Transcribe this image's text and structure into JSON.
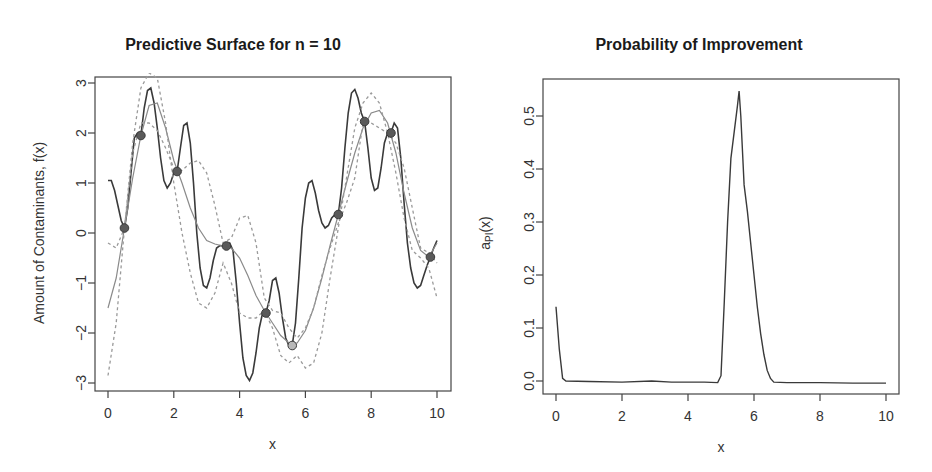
{
  "chart_data": [
    {
      "type": "line",
      "title": "Predictive Surface for n = 10",
      "xlabel": "x",
      "ylabel": "Amount of Contaminants, f(x)",
      "xlim": [
        0,
        10
      ],
      "ylim": [
        -3,
        3
      ],
      "xticks": [
        "0",
        "2",
        "4",
        "6",
        "8",
        "10"
      ],
      "yticks": [
        "-3",
        "-2",
        "-1",
        "0",
        "1",
        "2",
        "3"
      ],
      "grid": false,
      "legend": null,
      "points": {
        "x": [
          0.5,
          1.0,
          2.1,
          3.6,
          4.8,
          5.6,
          7.0,
          7.8,
          8.6,
          9.8
        ],
        "y": [
          0.1,
          1.95,
          1.23,
          -0.26,
          -1.6,
          -2.25,
          0.37,
          2.23,
          2.0,
          -0.48
        ],
        "highlight_index": 5
      },
      "series": [
        {
          "name": "sample path (dark solid)",
          "style": "solid-dark",
          "x": [
            0.0,
            0.1,
            0.2,
            0.3,
            0.4,
            0.5,
            0.6,
            0.7,
            0.8,
            0.9,
            1.0,
            1.1,
            1.2,
            1.3,
            1.4,
            1.5,
            1.6,
            1.7,
            1.8,
            1.9,
            2.0,
            2.1,
            2.2,
            2.3,
            2.4,
            2.5,
            2.6,
            2.7,
            2.8,
            2.9,
            3.0,
            3.1,
            3.2,
            3.3,
            3.4,
            3.5,
            3.6,
            3.7,
            3.8,
            3.9,
            4.0,
            4.1,
            4.2,
            4.3,
            4.4,
            4.5,
            4.6,
            4.7,
            4.8,
            4.9,
            5.0,
            5.1,
            5.2,
            5.3,
            5.4,
            5.5,
            5.6,
            5.7,
            5.8,
            5.9,
            6.0,
            6.1,
            6.2,
            6.3,
            6.4,
            6.5,
            6.6,
            6.7,
            6.8,
            6.9,
            7.0,
            7.1,
            7.2,
            7.3,
            7.4,
            7.5,
            7.6,
            7.7,
            7.8,
            7.9,
            8.0,
            8.1,
            8.2,
            8.3,
            8.4,
            8.5,
            8.6,
            8.7,
            8.8,
            8.9,
            9.0,
            9.1,
            9.2,
            9.3,
            9.4,
            9.5,
            9.6,
            9.7,
            9.8,
            9.9,
            10.0
          ],
          "y": [
            1.05,
            1.05,
            0.85,
            0.55,
            0.25,
            0.1,
            0.5,
            1.2,
            1.9,
            2.0,
            1.95,
            2.5,
            2.85,
            2.9,
            2.6,
            2.1,
            1.5,
            1.05,
            0.9,
            1.0,
            1.2,
            1.23,
            1.7,
            2.15,
            2.2,
            1.8,
            1.0,
            0.0,
            -0.7,
            -1.05,
            -1.1,
            -0.9,
            -0.55,
            -0.3,
            -0.25,
            -0.26,
            -0.26,
            -0.2,
            -0.35,
            -1.0,
            -1.8,
            -2.5,
            -2.85,
            -2.95,
            -2.8,
            -2.4,
            -1.9,
            -1.6,
            -1.6,
            -1.35,
            -0.95,
            -0.9,
            -1.2,
            -1.7,
            -2.1,
            -2.25,
            -2.25,
            -1.8,
            -0.9,
            0.1,
            0.7,
            1.0,
            1.05,
            0.8,
            0.45,
            0.2,
            0.1,
            0.15,
            0.3,
            0.37,
            0.37,
            0.9,
            1.7,
            2.4,
            2.8,
            2.87,
            2.7,
            2.4,
            2.23,
            1.7,
            1.1,
            0.85,
            0.9,
            1.3,
            1.8,
            2.0,
            2.0,
            2.2,
            2.1,
            1.5,
            0.6,
            -0.2,
            -0.7,
            -1.0,
            -1.1,
            -1.05,
            -0.85,
            -0.65,
            -0.48,
            -0.3,
            -0.15
          ]
        },
        {
          "name": "predictive mean (gray solid)",
          "style": "solid-gray",
          "x": [
            0.0,
            0.25,
            0.5,
            0.75,
            1.0,
            1.25,
            1.5,
            1.75,
            2.0,
            2.25,
            2.5,
            2.75,
            3.0,
            3.25,
            3.5,
            3.75,
            4.0,
            4.25,
            4.5,
            4.75,
            5.0,
            5.25,
            5.5,
            5.75,
            6.0,
            6.25,
            6.5,
            6.75,
            7.0,
            7.25,
            7.5,
            7.75,
            8.0,
            8.25,
            8.5,
            8.75,
            9.0,
            9.25,
            9.5,
            9.75,
            10.0
          ],
          "y": [
            -1.5,
            -0.9,
            0.1,
            1.1,
            1.95,
            2.55,
            2.6,
            2.1,
            1.45,
            1.0,
            0.5,
            0.1,
            -0.15,
            -0.22,
            -0.26,
            -0.3,
            -0.5,
            -0.85,
            -1.25,
            -1.55,
            -1.8,
            -2.05,
            -2.2,
            -2.2,
            -1.95,
            -1.5,
            -0.9,
            -0.25,
            0.37,
            1.0,
            1.6,
            2.1,
            2.4,
            2.45,
            2.2,
            1.6,
            0.8,
            0.1,
            -0.35,
            -0.48,
            -0.2
          ]
        },
        {
          "name": "upper band (gray dashed)",
          "style": "dashed-gray",
          "x": [
            0.0,
            0.25,
            0.5,
            0.75,
            1.0,
            1.25,
            1.5,
            1.75,
            2.0,
            2.25,
            2.5,
            2.75,
            3.0,
            3.25,
            3.5,
            3.75,
            4.0,
            4.25,
            4.5,
            4.75,
            5.0,
            5.25,
            5.5,
            5.75,
            6.0,
            6.25,
            6.5,
            6.75,
            7.0,
            7.25,
            7.5,
            7.75,
            8.0,
            8.25,
            8.5,
            8.75,
            9.0,
            9.25,
            9.5,
            9.75,
            10.0
          ],
          "y": [
            -0.2,
            -0.3,
            0.1,
            1.6,
            2.2,
            2.2,
            2.05,
            1.7,
            1.3,
            1.25,
            1.4,
            1.45,
            1.2,
            0.55,
            -0.2,
            -0.1,
            0.3,
            0.35,
            -0.2,
            -1.3,
            -1.55,
            -1.6,
            -1.9,
            -2.1,
            -1.9,
            -1.5,
            -0.85,
            -0.3,
            0.2,
            0.6,
            1.1,
            2.2,
            2.2,
            2.1,
            2.0,
            1.8,
            1.3,
            0.5,
            -0.3,
            -0.4,
            -0.6
          ]
        },
        {
          "name": "lower band (gray dashed)",
          "style": "dashed-gray",
          "x": [
            0.0,
            0.25,
            0.5,
            0.75,
            1.0,
            1.25,
            1.5,
            1.75,
            2.0,
            2.25,
            2.5,
            2.75,
            3.0,
            3.25,
            3.5,
            3.75,
            4.0,
            4.25,
            4.5,
            4.75,
            5.0,
            5.25,
            5.5,
            5.75,
            6.0,
            6.25,
            6.5,
            6.75,
            7.0,
            7.25,
            7.5,
            7.75,
            8.0,
            8.25,
            8.5,
            8.75,
            9.0,
            9.25,
            9.5,
            9.75,
            10.0
          ],
          "y": [
            -2.85,
            -1.8,
            0.1,
            1.8,
            2.9,
            3.2,
            3.1,
            2.2,
            1.0,
            0.0,
            -0.8,
            -1.4,
            -1.5,
            -1.2,
            -0.6,
            -1.0,
            -1.6,
            -1.7,
            -1.7,
            -1.55,
            -1.9,
            -2.45,
            -2.6,
            -2.45,
            -2.7,
            -2.6,
            -2.0,
            -0.9,
            0.1,
            1.1,
            2.1,
            2.6,
            2.8,
            2.6,
            2.0,
            1.2,
            0.3,
            -0.35,
            -0.5,
            -0.7,
            -1.3
          ]
        }
      ]
    },
    {
      "type": "line",
      "title": "Probability of Improvement",
      "xlabel": "x",
      "ylabel": "a_PI(x)",
      "ylabel_main": "a",
      "ylabel_sub": "PI",
      "ylabel_tail": "(x)",
      "xlim": [
        0,
        10
      ],
      "ylim": [
        0,
        0.56
      ],
      "xticks": [
        "0",
        "2",
        "4",
        "6",
        "8",
        "10"
      ],
      "yticks": [
        "0.0",
        "0.1",
        "0.2",
        "0.3",
        "0.4",
        "0.5"
      ],
      "grid": false,
      "legend": null,
      "series": [
        {
          "name": "PI",
          "x": [
            0.0,
            0.1,
            0.2,
            0.3,
            1.0,
            2.0,
            2.9,
            3.5,
            4.0,
            4.5,
            4.9,
            5.0,
            5.1,
            5.2,
            5.3,
            5.4,
            5.5,
            5.55,
            5.6,
            5.7,
            5.8,
            5.9,
            6.0,
            6.1,
            6.2,
            6.3,
            6.4,
            6.5,
            6.6,
            7.0,
            8.0,
            9.0,
            10.0
          ],
          "values": [
            0.14,
            0.06,
            0.005,
            0.0,
            -0.001,
            -0.002,
            0.0,
            -0.002,
            -0.002,
            -0.002,
            -0.003,
            0.01,
            0.15,
            0.3,
            0.42,
            0.47,
            0.52,
            0.547,
            0.5,
            0.37,
            0.32,
            0.26,
            0.2,
            0.14,
            0.09,
            0.05,
            0.02,
            0.005,
            -0.002,
            -0.003,
            -0.003,
            -0.004,
            -0.004
          ]
        }
      ]
    }
  ]
}
